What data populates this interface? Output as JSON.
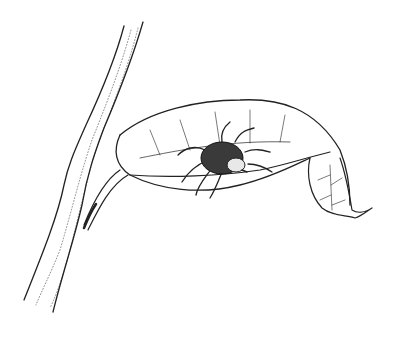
{
  "illustration": {
    "subject": "tick on a curled leaf attached to a plant stem",
    "style": "black ink line drawing on white",
    "elements": [
      "stem",
      "leaf",
      "leaf-veins",
      "tick"
    ],
    "colors": {
      "background": "#ffffff",
      "ink": "#222222",
      "tick_body": "#3a3a3a"
    }
  }
}
